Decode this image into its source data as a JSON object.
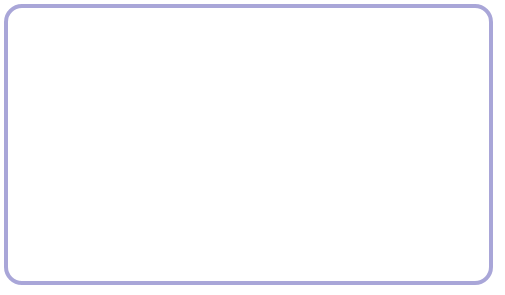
{
  "chart_data": {
    "type": "line",
    "title": "",
    "xlabel": "",
    "ylabel": "Percent of national income",
    "xlim": [
      1979,
      2010
    ],
    "ylim": [
      0,
      20
    ],
    "yticks": [
      2,
      4,
      6,
      8,
      10,
      12,
      14,
      16,
      18,
      20
    ],
    "xticks": [
      1979,
      1985,
      1990,
      1995,
      2000,
      2005,
      2010
    ],
    "xtick_labels": [
      "1979",
      "1985",
      "1990",
      "1995",
      "2000",
      "2005",
      "2010"
    ],
    "minor_xticks_every": 1,
    "grid": false,
    "legend_position": "top-left",
    "x": [
      1979,
      1980,
      1981,
      1982,
      1983,
      1984,
      1985,
      1986,
      1987,
      1988,
      1989,
      1990,
      1991,
      1992,
      1993,
      1994,
      1995,
      1996,
      1997,
      1998,
      1999,
      2000,
      2001,
      2002,
      2003,
      2004,
      2005,
      2006,
      2007,
      2008,
      2009,
      2010
    ],
    "series": [
      {
        "name": "Before-Tax Income the Lowest 20%",
        "color": "#c8632b",
        "values": [
          6.3,
          6.3,
          6.2,
          5.9,
          5.7,
          5.6,
          5.4,
          5.3,
          5.1,
          4.9,
          4.8,
          4.7,
          4.9,
          5.2,
          5.1,
          5.3,
          5.2,
          5.1,
          5.3,
          5.2,
          5.0,
          4.9,
          4.8,
          4.7,
          5.0,
          5.1,
          5.0,
          4.9,
          4.8,
          4.7,
          5.0,
          5.2
        ]
      },
      {
        "name": "After-Tax Income Lowest 20%",
        "color": "#6b7536",
        "values": [
          7.3,
          7.2,
          7.0,
          6.7,
          6.4,
          6.2,
          6.4,
          6.3,
          5.9,
          5.8,
          5.8,
          5.8,
          5.9,
          6.2,
          6.1,
          6.1,
          6.3,
          6.1,
          6.2,
          6.1,
          5.9,
          5.8,
          5.7,
          6.0,
          6.0,
          5.9,
          5.8,
          5.7,
          5.6,
          5.9,
          6.2,
          6.4
        ]
      },
      {
        "name": "Before-Tax Income Top 1%",
        "color": "#b43b36",
        "values": [
          8.9,
          8.9,
          8.9,
          9.3,
          9.8,
          10.2,
          10.8,
          13.7,
          11.0,
          13.2,
          12.6,
          12.2,
          11.0,
          12.1,
          11.7,
          11.6,
          11.6,
          12.5,
          13.4,
          14.2,
          15.3,
          17.4,
          15.4,
          13.2,
          13.9,
          15.5,
          17.4,
          18.1,
          18.7,
          15.9,
          13.4,
          15.0
        ]
      },
      {
        "name": "After-Tax Income Top 1%",
        "color": "#33417a",
        "values": [
          7.4,
          7.6,
          7.9,
          8.3,
          8.9,
          9.4,
          10.2,
          13.0,
          9.6,
          11.8,
          11.2,
          10.8,
          10.0,
          10.7,
          10.2,
          9.9,
          10.0,
          10.8,
          11.8,
          12.6,
          13.7,
          15.2,
          13.5,
          11.3,
          12.0,
          13.5,
          15.2,
          15.9,
          16.8,
          14.2,
          11.5,
          12.9
        ]
      }
    ]
  },
  "frame": {
    "border_color": "#a9a6d8",
    "background": "#ffffff"
  }
}
